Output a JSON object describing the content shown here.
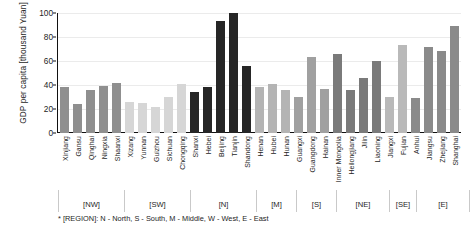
{
  "chart_data": {
    "type": "bar",
    "title": "",
    "xlabel": "",
    "ylabel": "GDP per capita [thousand Yuan]",
    "ylim": [
      0,
      100
    ],
    "yticks": [
      0,
      20,
      40,
      60,
      80,
      100
    ],
    "grid": true,
    "legend": "none",
    "categories": [
      "Xinjiang",
      "Gansu",
      "Qinghai",
      "Ningxia",
      "Shaanxi",
      "Xizang",
      "Yunnan",
      "Guizhou",
      "Sichuan",
      "Chongqing",
      "Shanxi",
      "Hebei",
      "Beijing",
      "Tianjin",
      "Shandong",
      "Henan",
      "Hubei",
      "Hunan",
      "Guangxi",
      "Guangdong",
      "Hainan",
      "Inner Mongolia",
      "Heilongjiang",
      "Jilin",
      "Liaoning",
      "Jiangxi",
      "Fujian",
      "Anhui",
      "Jiangsu",
      "Zhejiang",
      "Shanghai"
    ],
    "values": [
      38,
      24,
      36,
      39,
      42,
      26,
      25,
      22,
      30,
      41,
      34,
      38,
      93,
      100,
      56,
      38,
      41,
      36,
      30,
      63,
      37,
      66,
      36,
      46,
      60,
      30,
      73,
      29,
      72,
      68,
      89
    ],
    "group_of_category": [
      "NW",
      "NW",
      "NW",
      "NW",
      "NW",
      "SW",
      "SW",
      "SW",
      "SW",
      "SW",
      "N",
      "N",
      "N",
      "N",
      "N",
      "M",
      "M",
      "M",
      "S",
      "S",
      "S",
      "NE",
      "NE",
      "NE",
      "NE",
      "SE",
      "SE",
      "E",
      "E",
      "E",
      "E"
    ],
    "groups": [
      {
        "label": "[NW]",
        "count": 5,
        "color": "#8f8f8f"
      },
      {
        "label": "[SW]",
        "count": 5,
        "color": "#d6d6d6"
      },
      {
        "label": "[N]",
        "count": 5,
        "color": "#262626"
      },
      {
        "label": "[M]",
        "count": 3,
        "color": "#b4b4b4"
      },
      {
        "label": "[S]",
        "count": 3,
        "color": "#a0a0a0"
      },
      {
        "label": "[NE]",
        "count": 4,
        "color": "#7a7a7a"
      },
      {
        "label": "[SE]",
        "count": 2,
        "color": "#b9b9b9"
      },
      {
        "label": "[E]",
        "count": 4,
        "color": "#8a8a8a"
      }
    ],
    "footnote": "* [REGION]: N - North, S - South, M - Middle, W - West, E - East"
  }
}
